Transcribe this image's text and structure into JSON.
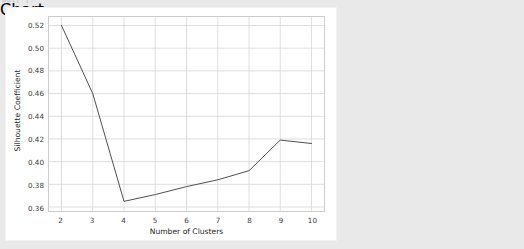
{
  "notebook": {
    "output_prompt": "Out[ ]:"
  },
  "figure": {
    "background_color": "#ffffff",
    "page_background_color": "#e9e9ea"
  },
  "chart_data": {
    "type": "line",
    "title": "",
    "xlabel": "Number of Clusters",
    "ylabel": "Silhouette Coefficient",
    "x": [
      2,
      3,
      4,
      5,
      6,
      7,
      8,
      9,
      10
    ],
    "values": [
      0.52,
      0.46,
      0.365,
      0.371,
      0.378,
      0.384,
      0.392,
      0.419,
      0.416
    ],
    "series": [
      {
        "name": "Silhouette Coefficient",
        "values": [
          0.52,
          0.46,
          0.365,
          0.371,
          0.378,
          0.384,
          0.392,
          0.419,
          0.416
        ],
        "color": "#4d4d4d"
      }
    ],
    "xlim": [
      1.6,
      10.4
    ],
    "ylim": [
      0.3565,
      0.5275
    ],
    "xticks": [
      2,
      3,
      4,
      5,
      6,
      7,
      8,
      9,
      10
    ],
    "xtick_labels": [
      "2",
      "3",
      "4",
      "5",
      "6",
      "7",
      "8",
      "9",
      "10"
    ],
    "yticks": [
      0.36,
      0.38,
      0.4,
      0.42,
      0.44,
      0.46,
      0.48,
      0.5,
      0.52
    ],
    "ytick_labels": [
      "0.36",
      "0.38",
      "0.40",
      "0.42",
      "0.44",
      "0.46",
      "0.48",
      "0.50",
      "0.52"
    ],
    "grid": true,
    "grid_color": "#d6d6d6",
    "axes_edge_color": "#cdcdcd",
    "legend": null,
    "legend_position": "none",
    "line_width": 1,
    "markers": false
  }
}
